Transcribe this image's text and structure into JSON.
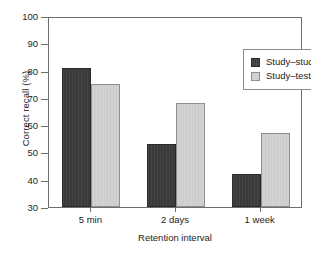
{
  "chart_data": {
    "type": "bar",
    "title": "",
    "xlabel": "Retention interval",
    "ylabel": "Correct recall (%)",
    "categories": [
      "5 min",
      "2 days",
      "1 week"
    ],
    "series": [
      {
        "name": "Study–study",
        "values": [
          81,
          53,
          42
        ],
        "color": "#3a3a3a"
      },
      {
        "name": "Study–test",
        "values": [
          75,
          68,
          57
        ],
        "color": "#d2d2d2"
      }
    ],
    "ylim": [
      30,
      100
    ],
    "yticks": [
      100,
      90,
      80,
      70,
      60,
      50,
      40,
      30
    ],
    "ytick_labels": [
      "100",
      "90",
      "80",
      "70",
      "60",
      "50",
      "40",
      "30"
    ],
    "grid": false,
    "legend_position": "upper right",
    "frame": true,
    "axis_color": "#6e6e6e"
  }
}
